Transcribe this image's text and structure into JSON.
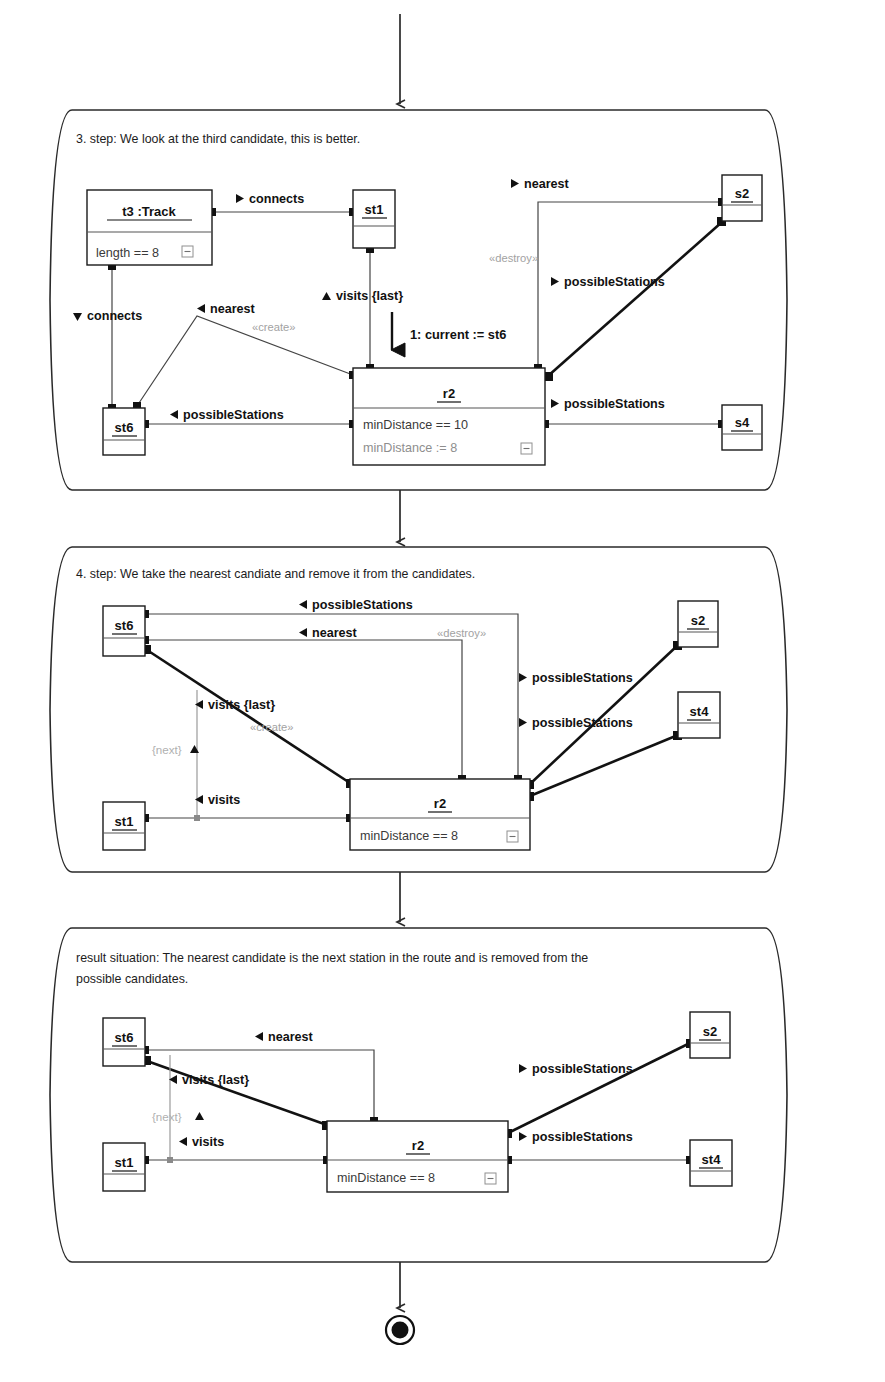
{
  "diagram": {
    "accent_color": "#111111",
    "gray_color": "#9a9a9a"
  },
  "panels": [
    {
      "id": "panel-step3",
      "caption": "3. step: We look at the third candidate, this is better.",
      "objects": [
        {
          "id": "t3",
          "name": "t3 :Track",
          "attributes": [
            {
              "text": "length == 8",
              "style": "normal"
            }
          ],
          "collapse": true
        },
        {
          "id": "st1",
          "name": "st1",
          "attributes": [],
          "collapse": false
        },
        {
          "id": "st6",
          "name": "st6",
          "attributes": [],
          "collapse": false
        },
        {
          "id": "s2",
          "name": "s2",
          "attributes": [],
          "collapse": false
        },
        {
          "id": "s4",
          "name": "s4",
          "attributes": [],
          "collapse": false
        },
        {
          "id": "r2",
          "name": "r2",
          "attributes": [
            {
              "text": "minDistance  == 10",
              "style": "normal"
            },
            {
              "text": "minDistance  := 8",
              "style": "gray"
            }
          ],
          "collapse": true
        }
      ],
      "links": [
        {
          "label": "connects",
          "direction": "right"
        },
        {
          "label": "connects",
          "direction": "down"
        },
        {
          "label": "nearest",
          "direction": "left",
          "stereotype": "«create»"
        },
        {
          "label": "possibleStations",
          "direction": "left"
        },
        {
          "label": "visits {last}",
          "direction": "up"
        },
        {
          "label": "nearest",
          "direction": "right",
          "stereotype": "«destroy»"
        },
        {
          "label": "possibleStations",
          "direction": "right"
        },
        {
          "label": "possibleStations",
          "direction": "right"
        }
      ],
      "messages": [
        {
          "text": "1: current := st6"
        }
      ]
    },
    {
      "id": "panel-step4",
      "caption": "4. step: We take the nearest candiate and remove it from the candidates.",
      "objects": [
        {
          "id": "st6",
          "name": "st6",
          "attributes": [],
          "collapse": false
        },
        {
          "id": "st1",
          "name": "st1",
          "attributes": [],
          "collapse": false
        },
        {
          "id": "s2",
          "name": "s2",
          "attributes": [],
          "collapse": false
        },
        {
          "id": "st4",
          "name": "st4",
          "attributes": [],
          "collapse": false
        },
        {
          "id": "r2",
          "name": "r2",
          "attributes": [
            {
              "text": "minDistance  == 8",
              "style": "normal"
            }
          ],
          "collapse": true
        }
      ],
      "links": [
        {
          "label": "possibleStations",
          "direction": "left",
          "stereotype": "«destroy»"
        },
        {
          "label": "nearest",
          "direction": "left"
        },
        {
          "label": "visits {last}",
          "direction": "left",
          "stereotype": "«create»"
        },
        {
          "label": "visits",
          "direction": "left"
        },
        {
          "label": "possibleStations",
          "direction": "right"
        },
        {
          "label": "possibleStations",
          "direction": "right"
        }
      ],
      "constraints": [
        {
          "text": "{next}"
        }
      ],
      "messages": []
    },
    {
      "id": "panel-result",
      "caption": "result situation: The nearest candidate is the next station in the route and is removed from the possible candidates.",
      "caption_line1": "result situation: The nearest candidate is the next station in the route and is removed from the",
      "caption_line2": "possible candidates.",
      "objects": [
        {
          "id": "st6",
          "name": "st6",
          "attributes": [],
          "collapse": false
        },
        {
          "id": "st1",
          "name": "st1",
          "attributes": [],
          "collapse": false
        },
        {
          "id": "s2",
          "name": "s2",
          "attributes": [],
          "collapse": false
        },
        {
          "id": "st4",
          "name": "st4",
          "attributes": [],
          "collapse": false
        },
        {
          "id": "r2",
          "name": "r2",
          "attributes": [
            {
              "text": "minDistance  == 8",
              "style": "normal"
            }
          ],
          "collapse": true
        }
      ],
      "links": [
        {
          "label": "nearest",
          "direction": "left"
        },
        {
          "label": "visits {last}",
          "direction": "left"
        },
        {
          "label": "visits",
          "direction": "left"
        },
        {
          "label": "possibleStations",
          "direction": "right"
        },
        {
          "label": "possibleStations",
          "direction": "right"
        }
      ],
      "constraints": [
        {
          "text": "{next}"
        }
      ],
      "messages": []
    }
  ],
  "flow": {
    "entry_arrow": "down-arrow-into-step3",
    "arrow_step3_to_step4": "down-arrow",
    "arrow_step4_to_result": "down-arrow",
    "final_node": "final-state"
  },
  "labels": {
    "connects": "connects",
    "nearest": "nearest",
    "possible_stations": "possibleStations",
    "visits": "visits",
    "visits_last": "visits {last}",
    "create": "«create»",
    "destroy": "«destroy»",
    "next": "{next}",
    "message_1": "1: current := st6",
    "t3_track": "t3 :Track",
    "length_eq_8": "length == 8",
    "min_distance_eq_10": "minDistance  == 10",
    "min_distance_assign_8": "minDistance  := 8",
    "min_distance_eq_8": "minDistance  == 8",
    "st1": "st1",
    "st6": "st6",
    "st4": "st4",
    "s2": "s2",
    "s4": "s4",
    "r2": "r2"
  }
}
